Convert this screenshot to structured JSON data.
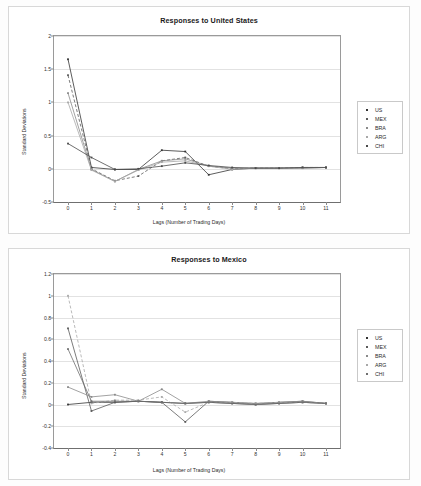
{
  "charts": [
    {
      "id": "responses-to-united-states",
      "title": "Responses to United States",
      "xlabel": "Lags (Number of Trading Days)",
      "ylabel": "Standard Deviations",
      "ylim": [
        -0.5,
        2
      ],
      "yticks": [
        "-0.5",
        "0",
        "0.5",
        "1",
        "1.5",
        "2"
      ],
      "ytickvals": [
        -0.5,
        0,
        0.5,
        1,
        1.5,
        2
      ],
      "xticks": [
        "0",
        "1",
        "2",
        "3",
        "4",
        "5",
        "6",
        "7",
        "8",
        "9",
        "10",
        "11"
      ],
      "legend": [
        "US",
        "MEX",
        "BRA",
        "ARG",
        "CHI"
      ]
    },
    {
      "id": "responses-to-mexico",
      "title": "Responses to Mexico",
      "xlabel": "Lags (Number of Trading Days)",
      "ylabel": "Standard Deviations",
      "ylim": [
        -0.4,
        1.2
      ],
      "yticks": [
        "-0.4",
        "-0.2",
        "0",
        "0.2",
        "0.4",
        "0.6",
        "0.8",
        "1",
        "1.2"
      ],
      "ytickvals": [
        -0.4,
        -0.2,
        0,
        0.2,
        0.4,
        0.6,
        0.8,
        1,
        1.2
      ],
      "xticks": [
        "0",
        "1",
        "2",
        "3",
        "4",
        "5",
        "6",
        "7",
        "8",
        "9",
        "10",
        "11"
      ],
      "legend": [
        "US",
        "MEX",
        "BRA",
        "ARG",
        "CHI"
      ]
    }
  ],
  "chart_data": [
    {
      "type": "line",
      "title": "Responses to United States",
      "xlabel": "Lags (Number of Trading Days)",
      "ylabel": "Standard Deviations",
      "x": [
        0,
        1,
        2,
        3,
        4,
        5,
        6,
        7,
        8,
        9,
        10,
        11
      ],
      "xlim": [
        0,
        11
      ],
      "ylim": [
        -0.5,
        2
      ],
      "grid": true,
      "legend_position": "right",
      "series": [
        {
          "name": "US",
          "color": "#333333",
          "dash": "solid",
          "values": [
            1.65,
            0.02,
            -0.01,
            -0.01,
            0.28,
            0.26,
            -0.09,
            -0.01,
            0.01,
            0.01,
            0.01,
            0.02
          ]
        },
        {
          "name": "MEX",
          "color": "#5a5a5a",
          "dash": "dashed",
          "values": [
            1.41,
            0.0,
            -0.18,
            -0.11,
            0.12,
            0.17,
            0.04,
            0.0,
            0.01,
            0.01,
            0.02,
            0.02
          ]
        },
        {
          "name": "BRA",
          "color": "#8a8a8a",
          "dash": "solid",
          "values": [
            1.14,
            -0.01,
            -0.19,
            -0.01,
            0.12,
            0.15,
            0.04,
            0.01,
            0.01,
            0.01,
            0.02,
            0.02
          ]
        },
        {
          "name": "ARG",
          "color": "#a8a8a8",
          "dash": "solid",
          "values": [
            1.0,
            -0.02,
            -0.19,
            -0.02,
            0.1,
            0.12,
            0.04,
            -0.01,
            0.01,
            0.01,
            0.01,
            0.02
          ]
        },
        {
          "name": "CHI",
          "color": "#4a4a4a",
          "dash": "solid",
          "values": [
            0.38,
            0.17,
            -0.01,
            0.0,
            0.04,
            0.09,
            0.05,
            0.02,
            0.01,
            0.01,
            0.02,
            0.02
          ]
        }
      ]
    },
    {
      "type": "line",
      "title": "Responses to Mexico",
      "xlabel": "Lags (Number of Trading Days)",
      "ylabel": "Standard Deviations",
      "x": [
        0,
        1,
        2,
        3,
        4,
        5,
        6,
        7,
        8,
        9,
        10,
        11
      ],
      "xlim": [
        0,
        11
      ],
      "ylim": [
        -0.4,
        1.2
      ],
      "grid": true,
      "legend_position": "right",
      "series": [
        {
          "name": "US",
          "color": "#333333",
          "dash": "solid",
          "values": [
            0.0,
            0.02,
            0.02,
            0.03,
            0.02,
            0.01,
            0.02,
            0.01,
            0.0,
            0.01,
            0.02,
            0.01
          ]
        },
        {
          "name": "MEX",
          "color": "#5a5a5a",
          "dash": "solid",
          "values": [
            0.7,
            -0.06,
            0.02,
            0.03,
            0.02,
            -0.16,
            0.03,
            0.02,
            0.01,
            0.02,
            0.03,
            0.01
          ]
        },
        {
          "name": "BRA",
          "color": "#8a8a8a",
          "dash": "solid",
          "values": [
            0.16,
            0.07,
            0.09,
            0.03,
            0.14,
            0.01,
            0.03,
            0.02,
            0.0,
            0.02,
            0.03,
            0.01
          ]
        },
        {
          "name": "ARG",
          "color": "#a8a8a8",
          "dash": "dashed",
          "values": [
            1.0,
            0.01,
            0.04,
            0.04,
            0.07,
            -0.07,
            0.02,
            0.02,
            0.01,
            0.02,
            0.02,
            0.01
          ]
        },
        {
          "name": "CHI",
          "color": "#6f6f6f",
          "dash": "solid",
          "values": [
            0.51,
            0.03,
            0.03,
            0.03,
            0.02,
            0.01,
            0.02,
            0.01,
            0.0,
            0.01,
            0.02,
            0.01
          ]
        }
      ]
    }
  ]
}
